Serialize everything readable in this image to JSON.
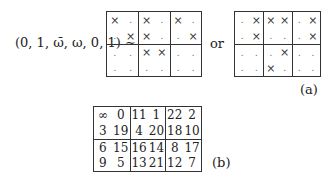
{
  "figure_a": {
    "tuple_label": "(0, 1, ω̄, ω, 0, 1) ∼",
    "connector": "or",
    "caption": "(a)",
    "left_grid": {
      "rows": [
        [
          "×",
          ".",
          "×",
          ".",
          "×",
          "."
        ],
        [
          ".",
          "×",
          "×",
          ".",
          ".",
          "×"
        ],
        [
          ".",
          ".",
          "×",
          "×",
          ".",
          "."
        ],
        [
          ".",
          ".",
          ".",
          ".",
          ".",
          "."
        ]
      ]
    },
    "right_grid": {
      "rows": [
        [
          ".",
          "×",
          "×",
          "×",
          ".",
          "×"
        ],
        [
          ".",
          "×",
          ".",
          ".",
          ".",
          "×"
        ],
        [
          ".",
          ".",
          ".",
          "×",
          ".",
          "."
        ],
        [
          ".",
          ".",
          "×",
          ".",
          ".",
          "."
        ]
      ]
    }
  },
  "figure_b": {
    "caption": "(b)",
    "grid": {
      "rows": [
        [
          "∞",
          "0",
          "11",
          "1",
          "22",
          "2"
        ],
        [
          "3",
          "19",
          "4",
          "20",
          "18",
          "10"
        ],
        [
          "6",
          "15",
          "16",
          "14",
          "8",
          "17"
        ],
        [
          "9",
          "5",
          "13",
          "21",
          "12",
          "7"
        ]
      ]
    }
  }
}
